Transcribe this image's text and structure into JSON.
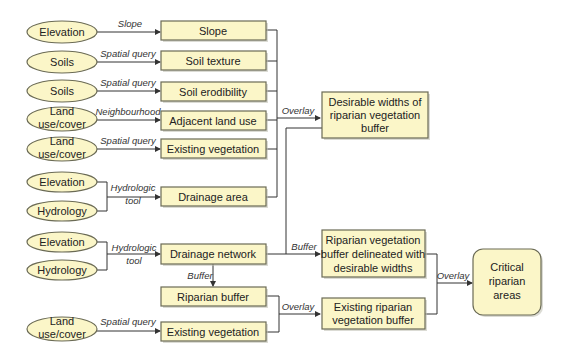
{
  "diagram": {
    "colors": {
      "fill": "#fbf6c8",
      "stroke": "#6b6b55",
      "line": "#333333"
    },
    "inputs": [
      {
        "id": "in1",
        "label": [
          "Elevation"
        ],
        "cx": 62,
        "cy": 32
      },
      {
        "id": "in2",
        "label": [
          "Soils"
        ],
        "cx": 62,
        "cy": 62
      },
      {
        "id": "in3",
        "label": [
          "Soils"
        ],
        "cx": 62,
        "cy": 91
      },
      {
        "id": "in4",
        "label": [
          "Land",
          "use/cover"
        ],
        "cx": 62,
        "cy": 119
      },
      {
        "id": "in5",
        "label": [
          "Land",
          "use/cover"
        ],
        "cx": 62,
        "cy": 149
      },
      {
        "id": "in6",
        "label": [
          "Elevation"
        ],
        "cx": 62,
        "cy": 182
      },
      {
        "id": "in7",
        "label": [
          "Hydrology"
        ],
        "cx": 62,
        "cy": 211
      },
      {
        "id": "in8",
        "label": [
          "Elevation"
        ],
        "cx": 62,
        "cy": 242
      },
      {
        "id": "in9",
        "label": [
          "Hydrology"
        ],
        "cx": 62,
        "cy": 270
      },
      {
        "id": "in10",
        "label": [
          "Land",
          "use/cover"
        ],
        "cx": 62,
        "cy": 329
      }
    ],
    "processes": [
      {
        "id": "p1",
        "label": "Slope",
        "via": "Slope",
        "y": 21
      },
      {
        "id": "p2",
        "label": "Soil texture",
        "via": "Spatial query",
        "y": 51
      },
      {
        "id": "p3",
        "label": "Soil erodibility",
        "via": "Spatial query",
        "y": 82
      },
      {
        "id": "p4",
        "label": "Adjacent land use",
        "via": "Neighbourhood",
        "y": 111
      },
      {
        "id": "p5",
        "label": "Existing vegetation",
        "via": "Spatial query",
        "y": 139
      },
      {
        "id": "p6",
        "label": "Drainage area",
        "via": [
          "Hydrologic",
          "tool"
        ],
        "y": 187
      },
      {
        "id": "p7",
        "label": "Drainage network",
        "via": [
          "Hydrologic",
          "tool"
        ],
        "y": 244
      },
      {
        "id": "p8",
        "label": "Riparian buffer",
        "via": "Buffer",
        "y": 287
      },
      {
        "id": "p9",
        "label": "Existing vegetation",
        "via": "Spatial query",
        "y": 322
      }
    ],
    "intermediate": [
      {
        "id": "m1",
        "label": [
          "Desirable widths of",
          "riparian vegetation",
          "buffer"
        ],
        "via": "Overlay"
      },
      {
        "id": "m2",
        "label": [
          "Riparian vegetation",
          "buffer delineated with",
          "desirable widths"
        ],
        "via": "Buffer"
      },
      {
        "id": "m3",
        "label": [
          "Existing riparian",
          "vegetation  buffer"
        ],
        "via": "Overlay"
      }
    ],
    "output": {
      "id": "o1",
      "label": [
        "Critical",
        "riparian",
        "areas"
      ],
      "via": "Overlay"
    }
  }
}
